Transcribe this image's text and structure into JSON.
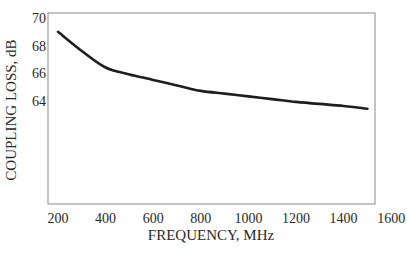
{
  "chart_data": {
    "type": "line",
    "title": "",
    "xlabel": "FREQUENCY, MHz",
    "ylabel": "COUPLING LOSS, dB",
    "xlim": [
      200,
      1600
    ],
    "ylim": [
      63.2,
      70
    ],
    "xticks": [
      200,
      400,
      600,
      800,
      1000,
      1200,
      1400,
      1600
    ],
    "yticks": [
      64,
      66,
      68,
      70
    ],
    "grid": false,
    "legend": null,
    "series": [
      {
        "name": "Coupling loss",
        "color": "#1e1e1e",
        "x": [
          200,
          300,
          400,
          500,
          600,
          700,
          800,
          900,
          1000,
          1100,
          1200,
          1300,
          1400,
          1500
        ],
        "y": [
          69.0,
          67.6,
          66.4,
          65.9,
          65.5,
          65.1,
          64.7,
          64.5,
          64.3,
          64.1,
          63.9,
          63.75,
          63.6,
          63.4
        ]
      }
    ]
  },
  "style": {
    "axis_color": "#8a8a8a",
    "line_color": "#1e1e1e",
    "text_color": "#2a2a2a",
    "background": "#ffffff"
  }
}
